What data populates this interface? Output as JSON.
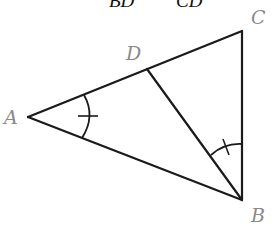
{
  "header_fragment": {
    "left_denominator": "BD",
    "right_denominator": "CD"
  },
  "vertices": {
    "A": {
      "label": "A",
      "x": 28,
      "y": 117
    },
    "B": {
      "label": "B",
      "x": 242,
      "y": 200
    },
    "C": {
      "label": "C",
      "x": 242,
      "y": 31
    },
    "D": {
      "label": "D",
      "x": 147,
      "y": 69
    }
  },
  "segments": [
    "AC",
    "AB",
    "CB",
    "BD"
  ],
  "angle_marks": [
    {
      "vertex": "A",
      "between": [
        "AD",
        "AB"
      ],
      "ticks": 1
    },
    {
      "vertex": "B",
      "between": [
        "BD",
        "BC"
      ],
      "ticks": 1
    }
  ],
  "colors": {
    "line": "#1a1a1a",
    "label": "#8a8a8a",
    "background": "#ffffff"
  }
}
